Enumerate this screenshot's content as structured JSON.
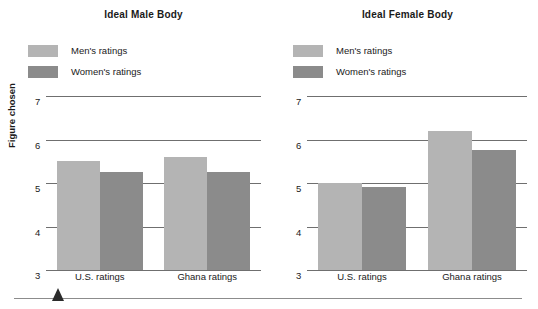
{
  "chart_data": [
    {
      "type": "bar",
      "title": "Ideal Male Body",
      "xlabel": "",
      "ylabel": "Figure chosen",
      "categories": [
        "U.S. ratings",
        "Ghana ratings"
      ],
      "series": [
        {
          "name": "Men's ratings",
          "color": "#b4b4b4",
          "values": [
            5.5,
            5.6
          ]
        },
        {
          "name": "Women's ratings",
          "color": "#8b8b8b",
          "values": [
            5.25,
            5.25
          ]
        }
      ],
      "ylim": [
        3,
        7
      ],
      "yticks": [
        3,
        4,
        5,
        6,
        7
      ],
      "ytick_labels": [
        "3",
        "4",
        "5",
        "6",
        "7"
      ],
      "grid": true,
      "legend_position": "top-left"
    },
    {
      "type": "bar",
      "title": "Ideal Female Body",
      "xlabel": "",
      "ylabel": "Figure chosen",
      "categories": [
        "U.S. ratings",
        "Ghana ratings"
      ],
      "series": [
        {
          "name": "Men's ratings",
          "color": "#b4b4b4",
          "values": [
            5.0,
            6.2
          ]
        },
        {
          "name": "Women's ratings",
          "color": "#8b8b8b",
          "values": [
            4.9,
            5.75
          ]
        }
      ],
      "ylim": [
        3,
        7
      ],
      "yticks": [
        3,
        4,
        5,
        6,
        7
      ],
      "ytick_labels": [
        "3",
        "4",
        "5",
        "6",
        "7"
      ],
      "grid": true,
      "legend_position": "top-left"
    }
  ],
  "colors": {
    "mens_ratings": "#b4b4b4",
    "womens_ratings": "#8b8b8b",
    "gridline": "#6f6f6f",
    "rule": "#8c8c8c",
    "marker": "#2b2b2b",
    "text": "#1a1a1a"
  },
  "panels": {
    "male": {
      "title": "Ideal Male Body",
      "ylabel": "Figure chosen",
      "legend": [
        {
          "label": "Men's ratings"
        },
        {
          "label": "Women's ratings"
        }
      ],
      "yticks": [
        "7",
        "6",
        "5",
        "4",
        "3"
      ],
      "categories": [
        "U.S. ratings",
        "Ghana ratings"
      ]
    },
    "female": {
      "title": "Ideal Female Body",
      "ylabel": "Figure chosen",
      "legend": [
        {
          "label": "Men's ratings"
        },
        {
          "label": "Women's ratings"
        }
      ],
      "yticks": [
        "7",
        "6",
        "5",
        "4",
        "3"
      ],
      "categories": [
        "U.S. ratings",
        "Ghana ratings"
      ]
    }
  }
}
